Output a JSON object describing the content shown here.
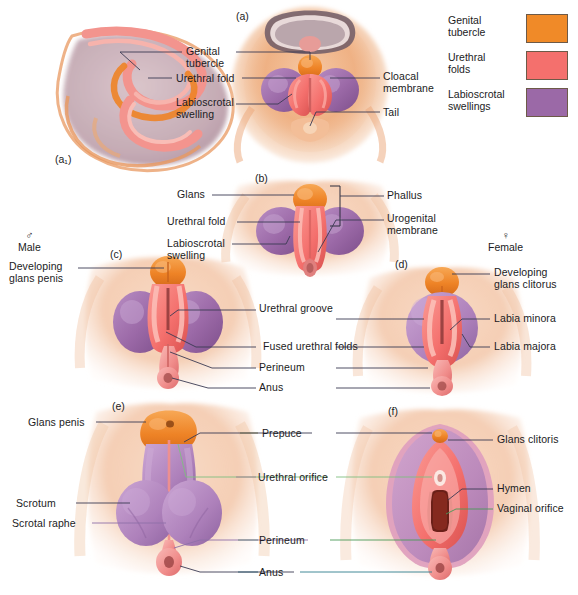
{
  "figure": {
    "panels": [
      {
        "id": "a1",
        "label": "(a₁)",
        "x": 55,
        "y": 153
      },
      {
        "id": "a",
        "label": "(a)",
        "x": 236,
        "y": 10
      },
      {
        "id": "b",
        "label": "(b)",
        "x": 255,
        "y": 172
      },
      {
        "id": "c",
        "label": "(c)",
        "x": 110,
        "y": 248
      },
      {
        "id": "d",
        "label": "(d)",
        "x": 395,
        "y": 258
      },
      {
        "id": "e",
        "label": "(e)",
        "x": 112,
        "y": 400
      },
      {
        "id": "f",
        "label": "(f)",
        "x": 388,
        "y": 405
      }
    ],
    "sex_headers": [
      {
        "name": "male",
        "symbol": "♂",
        "label": "Male",
        "x": 18,
        "y": 229
      },
      {
        "name": "female",
        "symbol": "♀",
        "label": "Female",
        "x": 488,
        "y": 229
      }
    ]
  },
  "legend": {
    "items": [
      {
        "label": "Genital\ntubercle",
        "color": "#F08A28",
        "name": "genital-tubercle"
      },
      {
        "label": "Urethral\nfolds",
        "color": "#F4706D",
        "name": "urethral-folds"
      },
      {
        "label": "Labioscrotal\nswellings",
        "color": "#9B69A7",
        "name": "labioscrotal-swellings"
      }
    ]
  },
  "labels": [
    {
      "name": "genital-tubercle",
      "text": "Genital\ntubercle",
      "x": 186,
      "y": 46,
      "align": "left"
    },
    {
      "name": "urethral-fold-a",
      "text": "Urethral fold",
      "x": 176,
      "y": 73,
      "align": "left"
    },
    {
      "name": "labioscrotal-swelling-a",
      "text": "Labioscrotal\nswelling",
      "x": 176,
      "y": 97,
      "align": "left"
    },
    {
      "name": "cloacal-membrane",
      "text": "Cloacal\nmembrane",
      "x": 383,
      "y": 71,
      "align": "left"
    },
    {
      "name": "tail",
      "text": "Tail",
      "x": 383,
      "y": 107,
      "align": "left"
    },
    {
      "name": "glans-b",
      "text": "Glans",
      "x": 177,
      "y": 189,
      "align": "left"
    },
    {
      "name": "urethral-fold-b",
      "text": "Urethral fold",
      "x": 167,
      "y": 216,
      "align": "left"
    },
    {
      "name": "labioscrotal-swelling-b",
      "text": "Labioscrotal\nswelling",
      "x": 167,
      "y": 238,
      "align": "left"
    },
    {
      "name": "phallus",
      "text": "Phallus",
      "x": 387,
      "y": 190,
      "align": "left"
    },
    {
      "name": "urogenital-membrane",
      "text": "Urogenital\nmembrane",
      "x": 387,
      "y": 213,
      "align": "left"
    },
    {
      "name": "developing-glans-penis",
      "text": "Developing\nglans penis",
      "x": 9,
      "y": 261,
      "align": "left"
    },
    {
      "name": "urethral-groove",
      "text": "Urethral groove",
      "x": 259,
      "y": 303,
      "align": "left"
    },
    {
      "name": "fused-urethral-folds",
      "text": "Fused urethral folds",
      "x": 263,
      "y": 341,
      "align": "left"
    },
    {
      "name": "perineum-cd",
      "text": "Perineum",
      "x": 259,
      "y": 362,
      "align": "left"
    },
    {
      "name": "anus-cd",
      "text": "Anus",
      "x": 259,
      "y": 382,
      "align": "left"
    },
    {
      "name": "developing-glans-clitorus",
      "text": "Developing\nglans clitorus",
      "x": 494,
      "y": 267,
      "align": "left"
    },
    {
      "name": "labia-minora",
      "text": "Labia minora",
      "x": 494,
      "y": 313,
      "align": "left"
    },
    {
      "name": "labia-majora",
      "text": "Labia majora",
      "x": 494,
      "y": 341,
      "align": "left"
    },
    {
      "name": "glans-penis",
      "text": "Glans penis",
      "x": 28,
      "y": 417,
      "align": "left"
    },
    {
      "name": "scrotum",
      "text": "Scrotum",
      "x": 16,
      "y": 498,
      "align": "left"
    },
    {
      "name": "scrotal-raphe",
      "text": "Scrotal raphe",
      "x": 12,
      "y": 518,
      "align": "left"
    },
    {
      "name": "prepuce",
      "text": "Prepuce",
      "x": 262,
      "y": 428,
      "align": "left"
    },
    {
      "name": "urethral-orifice",
      "text": "Urethral orifice",
      "x": 258,
      "y": 472,
      "align": "left"
    },
    {
      "name": "perineum-ef",
      "text": "Perineum",
      "x": 259,
      "y": 535,
      "align": "left"
    },
    {
      "name": "anus-ef",
      "text": "Anus",
      "x": 259,
      "y": 567,
      "align": "left"
    },
    {
      "name": "glans-clitoris",
      "text": "Glans clitoris",
      "x": 497,
      "y": 434,
      "align": "left"
    },
    {
      "name": "hymen",
      "text": "Hymen",
      "x": 497,
      "y": 483,
      "align": "left"
    },
    {
      "name": "vaginal-orifice",
      "text": "Vaginal orifice",
      "x": 497,
      "y": 503,
      "align": "left"
    }
  ],
  "colors": {
    "tubercle": "#F08A28",
    "folds": "#F4706D",
    "swellings": "#9B69A7",
    "skin": "#F0B288",
    "skin_light": "#F7D6BC",
    "leader": "#3a3a52",
    "leader_green": "#4a9a58",
    "leader_magenta": "#C24AA8",
    "leader_blue": "#5a5ac0",
    "leader_olive": "#8a8a3a"
  }
}
